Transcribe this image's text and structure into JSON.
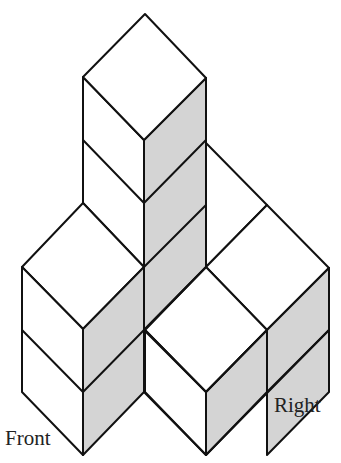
{
  "diagram": {
    "type": "isometric-cube-structure",
    "colors": {
      "top_face": "#ffffff",
      "left_face": "#ffffff",
      "right_face": "#d4d4d4",
      "stroke": "#111111"
    },
    "cube_count_visible": 7,
    "labels": {
      "front": "Front",
      "right": "Right"
    }
  }
}
